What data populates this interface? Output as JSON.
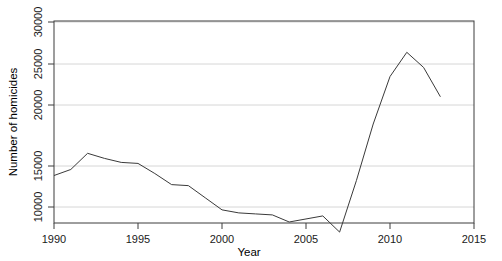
{
  "chart_data": {
    "type": "line",
    "title": "",
    "xlabel": "Year",
    "ylabel": "Number of homicides",
    "xlim": [
      1990,
      2015
    ],
    "ylim": [
      10000,
      30000
    ],
    "grid": true,
    "legend": "none",
    "xticks": [
      1990,
      1995,
      2000,
      2005,
      2010,
      2015
    ],
    "xtick_labels": [
      "1990",
      "1995",
      "2000",
      "2005",
      "2010",
      "2015"
    ],
    "yticks": [
      10000,
      15000,
      20000,
      25000,
      30000
    ],
    "ytick_labels": [
      "10000",
      "15000",
      "20000",
      "25000",
      "30000"
    ],
    "series": [
      {
        "name": "Homicides",
        "color": "#3a3a3a",
        "x": [
          1990,
          1991,
          1992,
          1993,
          1994,
          1995,
          1996,
          1997,
          1998,
          1999,
          2000,
          2001,
          2002,
          2003,
          2004,
          2005,
          2006,
          2007,
          2008,
          2009,
          2010,
          2011,
          2012,
          2013
        ],
        "values": [
          14700,
          15300,
          16900,
          16400,
          16000,
          15900,
          14900,
          13800,
          13700,
          12500,
          11300,
          11000,
          10900,
          10800,
          10100,
          10400,
          10700,
          9100,
          14200,
          19800,
          24500,
          26900,
          25400,
          22500
        ]
      }
    ]
  },
  "axes": {
    "x_axis_title": "Year",
    "y_axis_title": "Number of homicides"
  }
}
